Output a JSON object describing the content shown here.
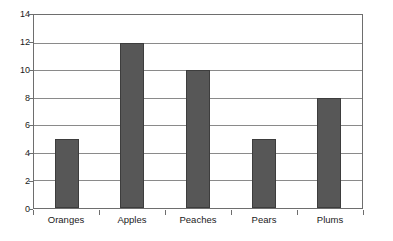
{
  "chart_data": {
    "type": "bar",
    "title": "",
    "subtitle": "",
    "xlabel": "",
    "ylabel": "",
    "categories": [
      "Oranges",
      "Apples",
      "Peaches",
      "Pears",
      "Plums"
    ],
    "values": [
      5,
      12,
      10,
      5,
      8
    ],
    "series": [
      {
        "name": "",
        "values": [
          5,
          12,
          10,
          5,
          8
        ]
      }
    ],
    "ylim": [
      0,
      14
    ],
    "ytick_step": 2,
    "yticks": [
      0,
      2,
      4,
      6,
      8,
      10,
      12,
      14
    ],
    "ytick_labels": [
      "0",
      "2",
      "4",
      "6",
      "8",
      "10",
      "12",
      "14"
    ],
    "grid": true,
    "grid_axis": "y",
    "legend": false,
    "legend_position": "none",
    "annotations": [],
    "colors": {
      "bar_fill": "#575757",
      "bar_edge": "#3d3d3d",
      "gridline": "#8a8a8a",
      "axis": "#6e6e6e",
      "text": "#1a1a1a",
      "background": "#ffffff"
    }
  }
}
